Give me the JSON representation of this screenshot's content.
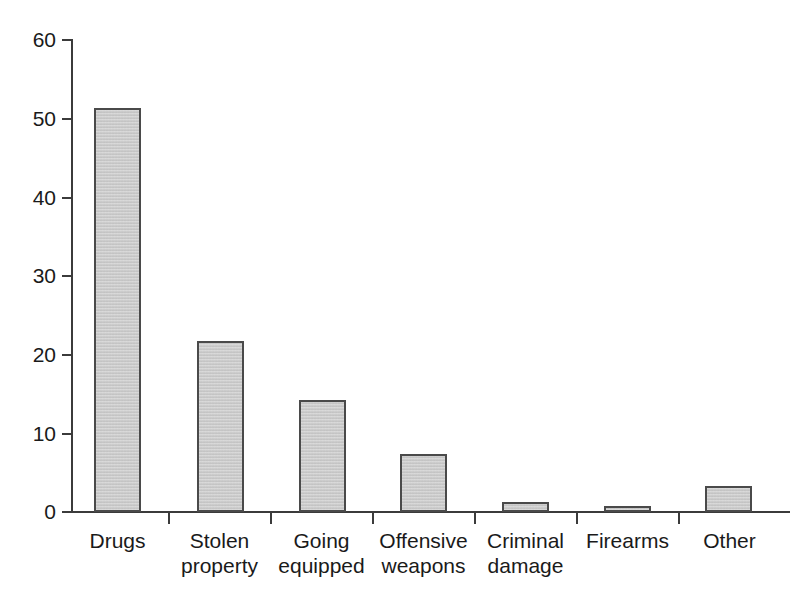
{
  "chart_data": {
    "type": "bar",
    "title": "",
    "subtitle": "",
    "xlabel": "",
    "ylabel": "",
    "categories": [
      "Drugs",
      "Stolen property",
      "Going equipped",
      "Offensive weapons",
      "Criminal damage",
      "Firearms",
      "Other"
    ],
    "category_lines": [
      [
        "Drugs",
        ""
      ],
      [
        "Stolen",
        "property"
      ],
      [
        "Going",
        "equipped"
      ],
      [
        "Offensive",
        "weapons"
      ],
      [
        "Criminal",
        "damage"
      ],
      [
        "Firearms",
        ""
      ],
      [
        "Other",
        ""
      ]
    ],
    "values": [
      51.2,
      21.7,
      14.2,
      7.4,
      1.3,
      0.7,
      3.3
    ],
    "ylim": [
      0,
      60
    ],
    "yticks": [
      0,
      10,
      20,
      30,
      40,
      50,
      60
    ],
    "ytick_labels": [
      "0",
      "10",
      "20",
      "30",
      "40",
      "50",
      "60"
    ],
    "grid": false,
    "legend": false,
    "legend_position": "none",
    "bar_fill_color": "#c9c9c9",
    "bar_edge_color": "#4a4a4a",
    "axis_color": "#3b3b3b",
    "background_color": "#ffffff"
  }
}
